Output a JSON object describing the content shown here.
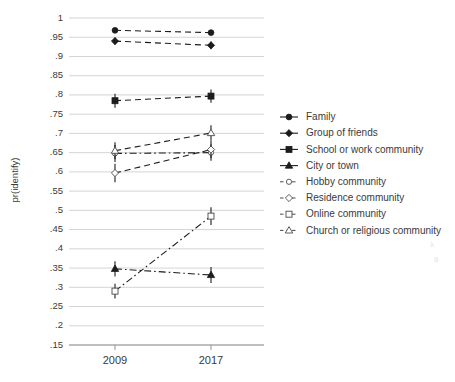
{
  "chart_data": {
    "type": "line",
    "title": "",
    "subtitle": "",
    "xlabel": "",
    "ylabel": "pr(identify)",
    "x": [
      "2009",
      "2017"
    ],
    "categories": [
      "2009",
      "2017"
    ],
    "ylim": [
      0.15,
      1.0
    ],
    "ytick_labels": [
      "1",
      ".95",
      ".9",
      ".85",
      ".8",
      ".75",
      ".7",
      ".65",
      ".6",
      ".55",
      ".5",
      ".45",
      ".4",
      ".35",
      ".3",
      ".25",
      ".2",
      ".15"
    ],
    "ytick_values": [
      1,
      0.95,
      0.9,
      0.85,
      0.8,
      0.75,
      0.7,
      0.65,
      0.6,
      0.55,
      0.5,
      0.45,
      0.4,
      0.35,
      0.3,
      0.25,
      0.2,
      0.15
    ],
    "xtick_labels": [
      "2009",
      "2017"
    ],
    "grid": "horizontal",
    "legend_position": "right",
    "series": [
      {
        "name": "Family",
        "marker": "filled-circle",
        "linestyle": "dashed",
        "values": [
          0.968,
          0.962
        ],
        "ci_low": [
          0.962,
          0.955
        ],
        "ci_high": [
          0.974,
          0.969
        ]
      },
      {
        "name": "Group of friends",
        "marker": "filled-diamond",
        "linestyle": "dashed",
        "values": [
          0.94,
          0.929
        ],
        "ci_low": [
          0.931,
          0.919
        ],
        "ci_high": [
          0.949,
          0.939
        ]
      },
      {
        "name": "School or work community",
        "marker": "filled-square",
        "linestyle": "dashed",
        "values": [
          0.785,
          0.797
        ],
        "ci_low": [
          0.767,
          0.78
        ],
        "ci_high": [
          0.803,
          0.814
        ]
      },
      {
        "name": "City or town",
        "marker": "filled-triangle",
        "linestyle": "dash-dot",
        "values": [
          0.348,
          0.332
        ],
        "ci_low": [
          0.328,
          0.311
        ],
        "ci_high": [
          0.368,
          0.353
        ]
      },
      {
        "name": "Hobby community",
        "marker": "open-circle",
        "linestyle": "dash-dot",
        "values": [
          0.648,
          0.65
        ],
        "ci_low": [
          0.626,
          0.629
        ],
        "ci_high": [
          0.67,
          0.671
        ]
      },
      {
        "name": "Residence community",
        "marker": "open-diamond",
        "linestyle": "dashed",
        "values": [
          0.597,
          0.658
        ],
        "ci_low": [
          0.573,
          0.636
        ],
        "ci_high": [
          0.621,
          0.68
        ]
      },
      {
        "name": "Online community",
        "marker": "open-square",
        "linestyle": "dash-dot",
        "values": [
          0.29,
          0.485
        ],
        "ci_low": [
          0.271,
          0.462
        ],
        "ci_high": [
          0.309,
          0.508
        ]
      },
      {
        "name": "Church or religious community",
        "marker": "open-triangle",
        "linestyle": "dashed",
        "values": [
          0.655,
          0.701
        ],
        "ci_low": [
          0.633,
          0.681
        ],
        "ci_high": [
          0.677,
          0.721
        ]
      }
    ]
  },
  "legend": {
    "items": [
      {
        "label": "Family"
      },
      {
        "label": "Group of friends"
      },
      {
        "label": "School or work community"
      },
      {
        "label": "City or town"
      },
      {
        "label": "Hobby community"
      },
      {
        "label": "Residence community"
      },
      {
        "label": "Online community"
      },
      {
        "label": "Church or religious community"
      }
    ]
  },
  "axes": {
    "y_title": "pr(identify)",
    "x_title": ""
  }
}
